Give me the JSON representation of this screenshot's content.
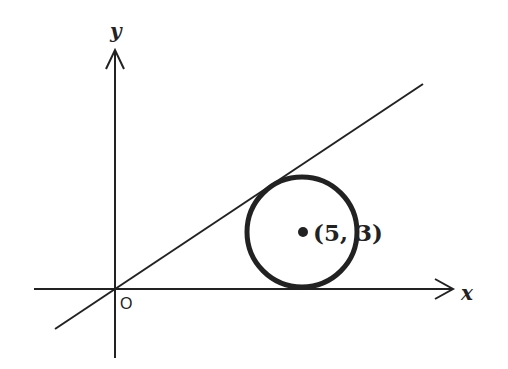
{
  "diagram": {
    "type": "coordinate-geometry",
    "colors": {
      "stroke": "#222222",
      "background": "#ffffff"
    },
    "axes": {
      "x_label": "x",
      "y_label": "y",
      "origin_label": "O"
    },
    "circle": {
      "center_label": "(5, 3)",
      "center": [
        5,
        3
      ],
      "radius": 3,
      "tangent_to": [
        "x-axis",
        "line through origin"
      ]
    },
    "line": {
      "passes_through": "origin",
      "tangent_to_circle": true
    }
  }
}
